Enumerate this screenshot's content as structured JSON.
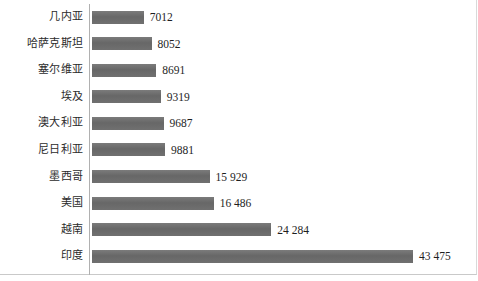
{
  "chart_data": {
    "type": "bar",
    "orientation": "horizontal",
    "title": "",
    "subtitle": "",
    "xlabel": "",
    "ylabel": "",
    "grid": false,
    "legend": null,
    "xlim": [
      0,
      43475
    ],
    "axis_line": true,
    "bar_color": "#6e6e6e",
    "background_color": "#ffffff",
    "categories": [
      "几内亚",
      "哈萨克斯坦",
      "塞尔维亚",
      "埃及",
      "澳大利亚",
      "尼日利亚",
      "墨西哥",
      "美国",
      "越南",
      "印度"
    ],
    "values": [
      7012,
      8052,
      8691,
      9319,
      9687,
      9881,
      15929,
      16486,
      24284,
      43475
    ],
    "value_labels": [
      "7012",
      "8052",
      "8691",
      "9319",
      "9687",
      "9881",
      "15 929",
      "16 486",
      "24 284",
      "43 475"
    ],
    "rows": [
      {
        "category": "几内亚",
        "value": 7012,
        "label": "7012"
      },
      {
        "category": "哈萨克斯坦",
        "value": 8052,
        "label": "8052"
      },
      {
        "category": "塞尔维亚",
        "value": 8691,
        "label": "8691"
      },
      {
        "category": "埃及",
        "value": 9319,
        "label": "9319"
      },
      {
        "category": "澳大利亚",
        "value": 9687,
        "label": "9687"
      },
      {
        "category": "尼日利亚",
        "value": 9881,
        "label": "9881"
      },
      {
        "category": "墨西哥",
        "value": 15929,
        "label": "15 929"
      },
      {
        "category": "美国",
        "value": 16486,
        "label": "16 486"
      },
      {
        "category": "越南",
        "value": 24284,
        "label": "24 284"
      },
      {
        "category": "印度",
        "value": 43475,
        "label": "43 475"
      }
    ]
  }
}
